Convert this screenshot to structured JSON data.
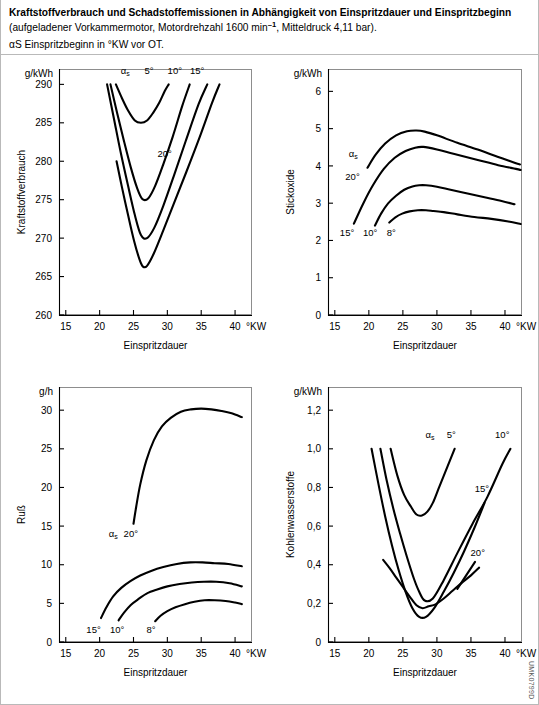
{
  "caption": {
    "title_bold": "Kraftstoffverbrauch und Schadstoffemissionen in Abhängigkeit von Einspritzdauer und Einspritzbeginn",
    "title_normal": " (aufgeladener Vorkammermotor, Motordrehzahl 1600 min",
    "title_normal_sup": "–1",
    "title_normal_tail": ", Mitteldruck 4,11 bar).",
    "subtitle": "αS Einspritzbeginn in °KW vor OT."
  },
  "watermark": "UMK0799D",
  "common": {
    "xlabel": "Einspritzdauer",
    "xunit": "°KW",
    "alpha_label": "αs"
  },
  "chart_data": [
    {
      "id": "kraftstoffverbrauch",
      "type": "line",
      "title": "",
      "ylabel": "Kraftstoffverbrauch",
      "yunit": "g/kWh",
      "xlabel": "Einspritzdauer",
      "xunit": "°KW",
      "xlim": [
        14,
        42.5
      ],
      "ylim": [
        260,
        292
      ],
      "xticks": [
        15,
        20,
        25,
        30,
        35,
        40
      ],
      "yticks": [
        260,
        265,
        270,
        275,
        280,
        285,
        290
      ],
      "grid": false,
      "legend_position": "inline-curve-labels",
      "series": [
        {
          "name": "5°",
          "label": "5°",
          "x": [
            22.4,
            23.3,
            24.2,
            25.2,
            26.1,
            27.0,
            27.9,
            28.8,
            29.6,
            30.2
          ],
          "y": [
            290.0,
            288.2,
            286.6,
            285.3,
            285.0,
            285.3,
            286.3,
            287.6,
            289.1,
            290.0
          ]
        },
        {
          "name": "10°",
          "label": "10°",
          "x": [
            21.6,
            22.6,
            23.6,
            24.6,
            25.5,
            26.3,
            27.2,
            28.2,
            29.4,
            30.8,
            32.2,
            33.3
          ],
          "y": [
            290.0,
            286.2,
            282.6,
            279.2,
            276.6,
            275.1,
            275.2,
            276.8,
            279.6,
            283.2,
            287.2,
            290.0
          ]
        },
        {
          "name": "15°",
          "label": "15°",
          "x": [
            21.1,
            22.1,
            23.1,
            24.2,
            25.2,
            26.1,
            27.0,
            28.1,
            29.4,
            31.0,
            32.7,
            34.6,
            35.9
          ],
          "y": [
            290.0,
            285.6,
            281.2,
            276.8,
            273.0,
            270.4,
            270.0,
            271.4,
            274.2,
            278.2,
            282.6,
            287.4,
            290.0
          ]
        },
        {
          "name": "20°",
          "label": "20°",
          "x": [
            22.5,
            23.3,
            24.2,
            25.1,
            25.9,
            26.4,
            27.0,
            28.0,
            29.4,
            31.0,
            32.8,
            34.8,
            36.6,
            37.7
          ],
          "y": [
            280.0,
            276.6,
            273.0,
            269.6,
            267.2,
            266.3,
            266.4,
            268.0,
            271.0,
            274.6,
            278.6,
            283.2,
            287.6,
            290.0
          ]
        }
      ]
    },
    {
      "id": "stickoxide",
      "type": "line",
      "title": "",
      "ylabel": "Stickoxide",
      "yunit": "g/kWh",
      "xlabel": "Einspritzdauer",
      "xunit": "°KW",
      "xlim": [
        14,
        42.5
      ],
      "ylim": [
        0,
        6.6
      ],
      "xticks": [
        15,
        20,
        25,
        30,
        35,
        40
      ],
      "yticks": [
        0,
        1,
        2,
        3,
        4,
        5,
        6
      ],
      "grid": false,
      "legend_position": "inline-curve-labels",
      "series": [
        {
          "name": "20°",
          "label": "20°",
          "x": [
            19.8,
            21.0,
            22.4,
            24.0,
            25.6,
            27.0,
            28.2,
            30.0,
            33.0,
            36.0,
            39.0,
            41.5,
            42.2
          ],
          "y": [
            3.95,
            4.3,
            4.6,
            4.82,
            4.93,
            4.95,
            4.92,
            4.82,
            4.62,
            4.44,
            4.24,
            4.08,
            4.04
          ]
        },
        {
          "name": "15°",
          "label": "15°",
          "x": [
            17.8,
            19.2,
            20.6,
            22.2,
            23.8,
            25.4,
            26.8,
            28.0,
            30.0,
            33.0,
            36.0,
            39.0,
            41.6,
            42.3
          ],
          "y": [
            2.45,
            3.0,
            3.48,
            3.92,
            4.22,
            4.4,
            4.49,
            4.51,
            4.44,
            4.3,
            4.16,
            4.02,
            3.92,
            3.89
          ]
        },
        {
          "name": "10°",
          "label": "10°",
          "x": [
            20.9,
            21.8,
            22.8,
            24.0,
            25.2,
            26.4,
            27.4,
            28.4,
            30.0,
            32.0,
            34.5,
            37.0,
            39.5,
            41.4
          ],
          "y": [
            2.4,
            2.72,
            2.99,
            3.2,
            3.36,
            3.45,
            3.48,
            3.48,
            3.44,
            3.36,
            3.26,
            3.16,
            3.06,
            2.97
          ]
        },
        {
          "name": "8°",
          "label": "8°",
          "x": [
            23.0,
            23.9,
            24.9,
            26.0,
            27.2,
            28.4,
            29.5,
            31.0,
            33.0,
            35.5,
            38.0,
            40.5,
            42.3
          ],
          "y": [
            2.48,
            2.62,
            2.72,
            2.78,
            2.81,
            2.81,
            2.79,
            2.76,
            2.7,
            2.63,
            2.58,
            2.51,
            2.44
          ]
        }
      ]
    },
    {
      "id": "russ",
      "type": "line",
      "title": "",
      "ylabel": "Ruß",
      "yunit": "g/h",
      "xlabel": "Einspritzdauer",
      "xunit": "°KW",
      "xlim": [
        14,
        42.5
      ],
      "ylim": [
        0,
        33
      ],
      "xticks": [
        15,
        20,
        25,
        30,
        35,
        40
      ],
      "yticks": [
        0,
        5,
        10,
        15,
        20,
        25,
        30
      ],
      "grid": false,
      "legend_position": "inline-curve-labels",
      "series": [
        {
          "name": "20°",
          "label": "20°",
          "x": [
            25.0,
            25.4,
            26.0,
            26.9,
            28.0,
            29.2,
            30.5,
            32.0,
            33.5,
            35.0,
            36.5,
            38.0,
            39.5,
            41.0
          ],
          "y": [
            15.3,
            17.5,
            20.4,
            23.5,
            26.1,
            27.9,
            29.0,
            29.8,
            30.1,
            30.2,
            30.1,
            29.9,
            29.6,
            29.1
          ]
        },
        {
          "name": "15°",
          "label": "15°",
          "x": [
            20.2,
            21.0,
            22.0,
            23.2,
            24.6,
            26.0,
            27.6,
            29.4,
            31.4,
            33.4,
            35.2,
            37.0,
            39.0,
            41.0
          ],
          "y": [
            3.1,
            4.5,
            5.9,
            7.0,
            7.9,
            8.6,
            9.2,
            9.7,
            10.1,
            10.3,
            10.3,
            10.2,
            10.1,
            9.8
          ]
        },
        {
          "name": "10°",
          "label": "10°",
          "x": [
            22.8,
            23.6,
            24.6,
            25.8,
            27.0,
            28.5,
            30.0,
            31.8,
            33.6,
            35.4,
            37.2,
            39.2,
            41.0
          ],
          "y": [
            2.8,
            3.8,
            4.8,
            5.6,
            6.3,
            6.8,
            7.2,
            7.5,
            7.7,
            7.8,
            7.8,
            7.6,
            7.2
          ]
        },
        {
          "name": "8°",
          "label": "8°",
          "x": [
            28.2,
            29.0,
            30.0,
            31.2,
            32.6,
            34.0,
            35.5,
            37.0,
            38.6,
            40.0,
            41.0
          ],
          "y": [
            2.7,
            3.4,
            4.0,
            4.5,
            4.9,
            5.2,
            5.4,
            5.4,
            5.3,
            5.1,
            4.9
          ]
        }
      ]
    },
    {
      "id": "kohlenwasserstoffe",
      "type": "line",
      "title": "",
      "ylabel": "Kohlenwasserstoffe",
      "yunit": "g/kWh",
      "xlabel": "Einspritzdauer",
      "xunit": "°KW",
      "xlim": [
        14,
        42.5
      ],
      "ylim": [
        0,
        1.32
      ],
      "xticks": [
        15,
        20,
        25,
        30,
        35,
        40
      ],
      "yticks": [
        0,
        0.2,
        0.4,
        0.6,
        0.8,
        1.0,
        1.2
      ],
      "ytick_labels": [
        "0",
        "0,2",
        "0,4",
        "0,6",
        "0,8",
        "1,0",
        "1,2"
      ],
      "grid": false,
      "legend_position": "inline-curve-labels",
      "series": [
        {
          "name": "5°",
          "label": "5°",
          "x": [
            23.2,
            24.2,
            25.2,
            26.2,
            27.0,
            27.8,
            28.6,
            29.4,
            30.2,
            31.0,
            31.8,
            32.6
          ],
          "y": [
            1.0,
            0.86,
            0.76,
            0.7,
            0.66,
            0.655,
            0.675,
            0.72,
            0.79,
            0.86,
            0.93,
            1.0
          ]
        },
        {
          "name": "10°",
          "label": "10°",
          "x": [
            21.7,
            22.6,
            23.6,
            24.6,
            25.6,
            26.6,
            27.4,
            28.2,
            29.4,
            31.0,
            33.0,
            35.2,
            37.4,
            39.6,
            40.8
          ],
          "y": [
            1.0,
            0.84,
            0.69,
            0.56,
            0.44,
            0.33,
            0.26,
            0.215,
            0.225,
            0.32,
            0.46,
            0.61,
            0.75,
            0.92,
            1.0
          ]
        },
        {
          "name": "15°",
          "label": "15°",
          "x": [
            20.4,
            21.4,
            22.4,
            23.4,
            24.4,
            25.4,
            26.4,
            27.4,
            28.4,
            29.6,
            31.0,
            32.5,
            34.0,
            35.5,
            37.0
          ],
          "y": [
            1.0,
            0.82,
            0.65,
            0.5,
            0.37,
            0.26,
            0.175,
            0.13,
            0.13,
            0.175,
            0.26,
            0.36,
            0.47,
            0.59,
            0.72
          ]
        },
        {
          "name": "20°",
          "label": "20°",
          "x": [
            22.1,
            23.0,
            24.0,
            25.0,
            26.0,
            27.0,
            27.9,
            28.8,
            29.8,
            31.0,
            32.3,
            33.6,
            35.0,
            36.2
          ],
          "y": [
            0.425,
            0.385,
            0.335,
            0.285,
            0.235,
            0.19,
            0.175,
            0.185,
            0.195,
            0.225,
            0.265,
            0.305,
            0.345,
            0.385
          ]
        }
      ]
    }
  ]
}
